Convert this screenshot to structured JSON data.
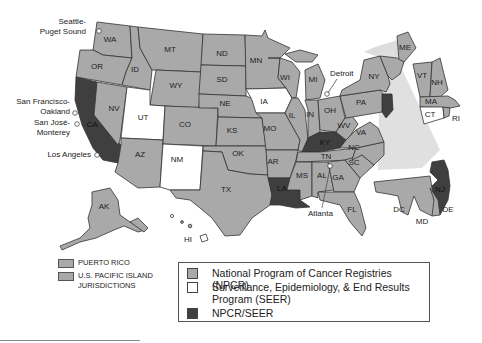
{
  "map": {
    "states": {
      "WA": {
        "label": "WA",
        "program": "npcr"
      },
      "OR": {
        "label": "OR",
        "program": "npcr"
      },
      "CA": {
        "label": "CA",
        "program": "both"
      },
      "ID": {
        "label": "ID",
        "program": "npcr"
      },
      "NV": {
        "label": "NV",
        "program": "npcr"
      },
      "MT": {
        "label": "MT",
        "program": "npcr"
      },
      "WY": {
        "label": "WY",
        "program": "npcr"
      },
      "UT": {
        "label": "UT",
        "program": "seer"
      },
      "AZ": {
        "label": "AZ",
        "program": "npcr"
      },
      "CO": {
        "label": "CO",
        "program": "npcr"
      },
      "NM": {
        "label": "NM",
        "program": "seer"
      },
      "ND": {
        "label": "ND",
        "program": "npcr"
      },
      "SD": {
        "label": "SD",
        "program": "npcr"
      },
      "NE": {
        "label": "NE",
        "program": "npcr"
      },
      "KS": {
        "label": "KS",
        "program": "npcr"
      },
      "OK": {
        "label": "OK",
        "program": "npcr"
      },
      "TX": {
        "label": "TX",
        "program": "npcr"
      },
      "MN": {
        "label": "MN",
        "program": "npcr"
      },
      "IA": {
        "label": "IA",
        "program": "seer"
      },
      "MO": {
        "label": "MO",
        "program": "npcr"
      },
      "AR": {
        "label": "AR",
        "program": "npcr"
      },
      "LA": {
        "label": "LA",
        "program": "both"
      },
      "WI": {
        "label": "WI",
        "program": "npcr"
      },
      "IL": {
        "label": "IL",
        "program": "npcr"
      },
      "MI": {
        "label": "MI",
        "program": "npcr"
      },
      "IN": {
        "label": "IN",
        "program": "npcr"
      },
      "OH": {
        "label": "OH",
        "program": "npcr"
      },
      "KY": {
        "label": "KY",
        "program": "both"
      },
      "TN": {
        "label": "TN",
        "program": "npcr"
      },
      "MS": {
        "label": "MS",
        "program": "npcr"
      },
      "AL": {
        "label": "AL",
        "program": "npcr"
      },
      "GA": {
        "label": "GA",
        "program": "npcr"
      },
      "FL": {
        "label": "FL",
        "program": "npcr"
      },
      "SC": {
        "label": "SC",
        "program": "npcr"
      },
      "NC": {
        "label": "NC",
        "program": "npcr"
      },
      "VA": {
        "label": "VA",
        "program": "npcr"
      },
      "WV": {
        "label": "WV",
        "program": "npcr"
      },
      "PA": {
        "label": "PA",
        "program": "npcr"
      },
      "NY": {
        "label": "NY",
        "program": "npcr"
      },
      "NJ": {
        "label": "NJ",
        "program": "both"
      },
      "DE": {
        "label": "DE",
        "program": "npcr"
      },
      "MD": {
        "label": "MD",
        "program": "npcr"
      },
      "DC": {
        "label": "DC",
        "program": "npcr"
      },
      "ME": {
        "label": "ME",
        "program": "npcr"
      },
      "VT": {
        "label": "VT",
        "program": "npcr"
      },
      "NH": {
        "label": "NH",
        "program": "npcr"
      },
      "MA": {
        "label": "MA",
        "program": "npcr"
      },
      "CT": {
        "label": "CT",
        "program": "seer"
      },
      "RI": {
        "label": "RI",
        "program": "npcr"
      },
      "AK": {
        "label": "AK",
        "program": "npcr"
      },
      "HI": {
        "label": "HI",
        "program": "seer"
      }
    },
    "cities": {
      "seattle_1": "Seattle-",
      "seattle_2": "Puget Sound",
      "sf_1": "San Francisco-",
      "sf_2": "Oakland",
      "sj_1": "San José-",
      "sj_2": "Monterey",
      "la": "Los Angeles",
      "detroit": "Detroit",
      "atlanta": "Atlanta"
    }
  },
  "territories": {
    "puerto_rico": "PUERTO RICO",
    "pacific_1": "U.S. PACIFIC ISLAND",
    "pacific_2": "JURISDICTIONS"
  },
  "legend": {
    "npcr": "National Program of Cancer Registries (NPCR)",
    "seer_1": "Surveillance, Epidemiology, & End Results",
    "seer_2": "Program (SEER)",
    "both": "NPCR/SEER"
  },
  "colors": {
    "npcr": "#a9a9a9",
    "seer": "#ffffff",
    "both": "#3f3f3f",
    "border": "#333333"
  }
}
